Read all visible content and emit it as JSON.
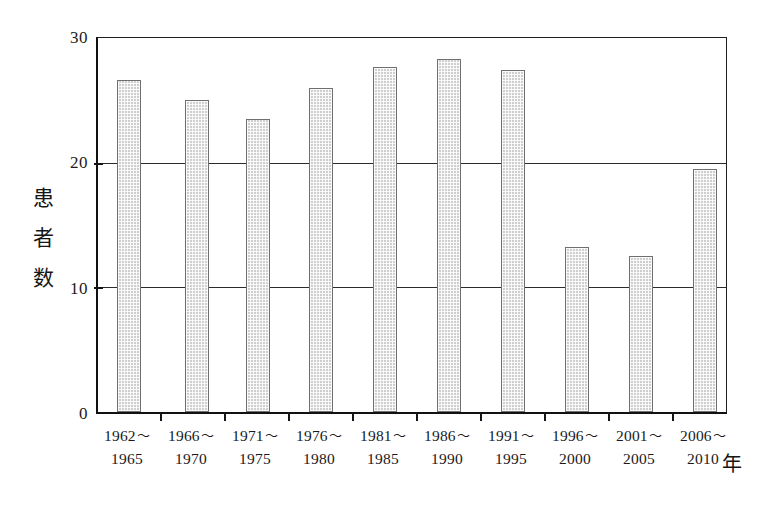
{
  "chart_data": {
    "type": "bar",
    "title": "",
    "xlabel": "年",
    "ylabel": "患者数",
    "ylabel_chars": [
      "患",
      "者",
      "数"
    ],
    "ylim": [
      0,
      30
    ],
    "yticks": [
      0,
      10,
      20,
      30
    ],
    "ytick_labels": [
      "0",
      "10",
      "20",
      "30"
    ],
    "gridlines": [
      10,
      20
    ],
    "grid": true,
    "legend": false,
    "categories": [
      "1962〜1965",
      "1966〜1970",
      "1971〜1975",
      "1976〜1980",
      "1981〜1985",
      "1986〜1990",
      "1991〜1995",
      "1996〜2000",
      "2001〜2005",
      "2006〜2010"
    ],
    "category_lines": [
      {
        "line1": "1962",
        "tilde": "〜",
        "line2": "1965"
      },
      {
        "line1": "1966",
        "tilde": "〜",
        "line2": "1970"
      },
      {
        "line1": "1971",
        "tilde": "〜",
        "line2": "1975"
      },
      {
        "line1": "1976",
        "tilde": "〜",
        "line2": "1980"
      },
      {
        "line1": "1981",
        "tilde": "〜",
        "line2": "1985"
      },
      {
        "line1": "1986",
        "tilde": "〜",
        "line2": "1990"
      },
      {
        "line1": "1991",
        "tilde": "〜",
        "line2": "1995"
      },
      {
        "line1": "1996",
        "tilde": "〜",
        "line2": "2000"
      },
      {
        "line1": "2001",
        "tilde": "〜",
        "line2": "2005"
      },
      {
        "line1": "2006",
        "tilde": "〜",
        "line2": "2010"
      }
    ],
    "values": [
      26.6,
      25.0,
      23.5,
      26.0,
      27.7,
      28.3,
      27.4,
      13.2,
      12.5,
      19.5
    ],
    "bar_color": "#cfcfcf",
    "bar_edge_color": "#6f6f6f",
    "axis_color": "#141414"
  }
}
